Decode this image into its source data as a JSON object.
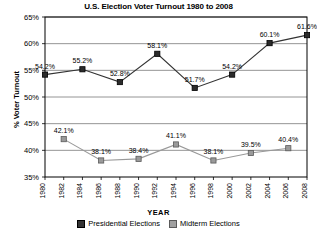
{
  "chart_data": {
    "type": "line",
    "title": "U.S. Election Voter Turnout 1980 to 2008",
    "xlabel": "YEAR",
    "ylabel": "% Voter Turnout",
    "ylim": [
      35,
      65
    ],
    "ytick_values": [
      35,
      40,
      45,
      50,
      55,
      60,
      65
    ],
    "ytick_labels": [
      "35%",
      "40%",
      "45%",
      "50%",
      "55%",
      "60%",
      "65%"
    ],
    "xlim": [
      1980,
      2008
    ],
    "x": [
      1980,
      1982,
      1984,
      1986,
      1988,
      1990,
      1992,
      1994,
      1996,
      1998,
      2000,
      2002,
      2004,
      2006,
      2008
    ],
    "xtick_labels": [
      "1980",
      "1982",
      "1984",
      "1986",
      "1988",
      "1990",
      "1992",
      "1994",
      "1996",
      "1998",
      "2000",
      "2002",
      "2004",
      "2006",
      "2008"
    ],
    "grid": true,
    "legend_position": "bottom",
    "series": [
      {
        "name": "Presidential Elections",
        "color": "#333333",
        "marker": "square-filled-dark",
        "points": [
          {
            "x": 1980,
            "y": 54.2,
            "label": "54.2%"
          },
          {
            "x": 1984,
            "y": 55.2,
            "label": "55.2%"
          },
          {
            "x": 1988,
            "y": 52.8,
            "label": "52.8%"
          },
          {
            "x": 1992,
            "y": 58.1,
            "label": "58.1%"
          },
          {
            "x": 1996,
            "y": 51.7,
            "label": "51.7%"
          },
          {
            "x": 2000,
            "y": 54.2,
            "label": "54.2%"
          },
          {
            "x": 2004,
            "y": 60.1,
            "label": "60.1%"
          },
          {
            "x": 2008,
            "y": 61.6,
            "label": "61.6%"
          }
        ]
      },
      {
        "name": "Midterm Elections",
        "color": "#999999",
        "marker": "square-filled-gray",
        "points": [
          {
            "x": 1982,
            "y": 42.1,
            "label": "42.1%"
          },
          {
            "x": 1986,
            "y": 38.1,
            "label": "38.1%"
          },
          {
            "x": 1990,
            "y": 38.4,
            "label": "38.4%"
          },
          {
            "x": 1994,
            "y": 41.1,
            "label": "41.1%"
          },
          {
            "x": 1998,
            "y": 38.1,
            "label": "38.1%"
          },
          {
            "x": 2002,
            "y": 39.5,
            "label": "39.5%"
          },
          {
            "x": 2006,
            "y": 40.4,
            "label": "40.4%"
          }
        ]
      }
    ]
  },
  "legend": {
    "items": [
      {
        "label": "Presidential Elections",
        "color": "#333333"
      },
      {
        "label": "Midterm Elections",
        "color": "#a0a0a0"
      }
    ]
  }
}
